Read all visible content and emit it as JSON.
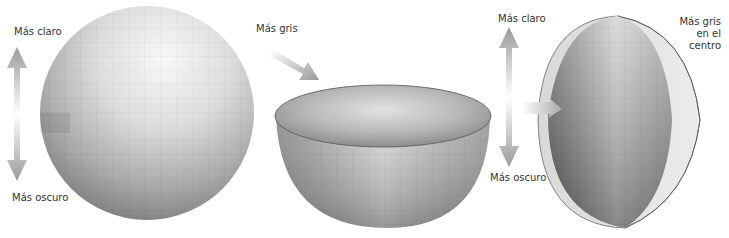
{
  "figure": {
    "panels": [
      {
        "id": "sphere",
        "top_label": "Más claro",
        "bottom_label": "Más oscuro"
      },
      {
        "id": "hemisphere-horizontal-cut",
        "arrow_label": "Más gris"
      },
      {
        "id": "hemisphere-vertical-cut",
        "top_label": "Más claro",
        "bottom_label": "Más oscuro",
        "side_label_lines": [
          "Más gris",
          "en el",
          "centro"
        ]
      }
    ],
    "colors": {
      "background": "#ffffff",
      "arrow": "#9a9a9a",
      "text": "#333333",
      "sphere_light": "#f4f4f4",
      "sphere_dark": "#6e6e6e"
    }
  }
}
